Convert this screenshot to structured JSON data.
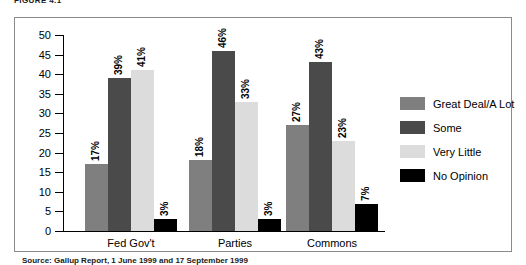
{
  "figure": {
    "caption": "FIGURE 4.1",
    "source_note": "Source: Gallup Report, 1 June 1999 and 17 September 1999"
  },
  "chart_data": {
    "type": "bar",
    "title": "",
    "xlabel": "",
    "ylabel": "",
    "categories": [
      "Fed Gov't",
      "Parties",
      "Commons"
    ],
    "ylim": [
      0,
      50
    ],
    "yticks": [
      0,
      5,
      10,
      15,
      20,
      25,
      30,
      35,
      40,
      45,
      50
    ],
    "grid": false,
    "legend_position": "right",
    "series": [
      {
        "name": "Great Deal/A Lot",
        "color": "#7f7f7f",
        "values": [
          17,
          18,
          27
        ],
        "labels": [
          "17%",
          "18%",
          "27%"
        ]
      },
      {
        "name": "Some",
        "color": "#4a4a4a",
        "values": [
          39,
          46,
          43
        ],
        "labels": [
          "39%",
          "46%",
          "43%"
        ]
      },
      {
        "name": "Very Little",
        "color": "#dcdcdc",
        "values": [
          41,
          33,
          23
        ],
        "labels": [
          "41%",
          "33%",
          "23%"
        ]
      },
      {
        "name": "No Opinion",
        "color": "#000000",
        "values": [
          3,
          3,
          7
        ],
        "labels": [
          "3%",
          "3%",
          "7%"
        ]
      }
    ]
  }
}
